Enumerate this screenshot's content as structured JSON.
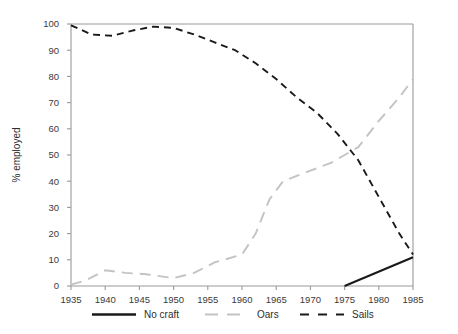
{
  "chart_data": {
    "type": "line",
    "title": "",
    "xlabel": "",
    "ylabel": "% employed",
    "xlim": [
      1935,
      1985
    ],
    "ylim": [
      0,
      100
    ],
    "xticks": [
      1935,
      1940,
      1945,
      1950,
      1955,
      1960,
      1965,
      1970,
      1975,
      1980,
      1985
    ],
    "yticks": [
      0,
      10,
      20,
      30,
      40,
      50,
      60,
      70,
      80,
      90,
      100
    ],
    "grid": false,
    "legend_position": "bottom",
    "series": [
      {
        "name": "No craft",
        "color": "#1a1a1a",
        "style": "solid",
        "x": [
          1975,
          1985
        ],
        "values": [
          0,
          11
        ]
      },
      {
        "name": "Oars",
        "color": "#c3c3c3",
        "style": "dashed",
        "x": [
          1935,
          1937,
          1940,
          1943,
          1946,
          1950,
          1953,
          1956,
          1960,
          1962,
          1964,
          1966,
          1968,
          1970,
          1973,
          1977,
          1980,
          1983,
          1985
        ],
        "values": [
          0.5,
          2,
          6,
          5,
          4.5,
          3,
          5,
          9,
          12,
          20,
          33,
          40,
          42,
          44,
          47,
          53,
          63,
          72,
          79
        ]
      },
      {
        "name": "Sails",
        "color": "#1a1a1a",
        "style": "dashed",
        "x": [
          1935,
          1938,
          1941,
          1944,
          1947,
          1950,
          1953,
          1956,
          1959,
          1962,
          1965,
          1968,
          1971,
          1974,
          1977,
          1980,
          1983,
          1985
        ],
        "values": [
          99.5,
          96,
          95.5,
          97.5,
          99,
          98.5,
          96,
          93,
          90,
          85,
          79,
          72,
          66,
          58,
          48,
          34,
          20,
          12
        ]
      }
    ]
  },
  "legend": {
    "items": [
      {
        "label": "No craft"
      },
      {
        "label": "Oars"
      },
      {
        "label": "Sails"
      }
    ]
  },
  "axes": {
    "y_title": "% employed",
    "x_tick_labels": [
      "1935",
      "1940",
      "1945",
      "1950",
      "1955",
      "1960",
      "1965",
      "1970",
      "1975",
      "1980",
      "1985"
    ],
    "y_tick_labels": [
      "0",
      "10",
      "20",
      "30",
      "40",
      "50",
      "60",
      "70",
      "80",
      "90",
      "100"
    ]
  }
}
